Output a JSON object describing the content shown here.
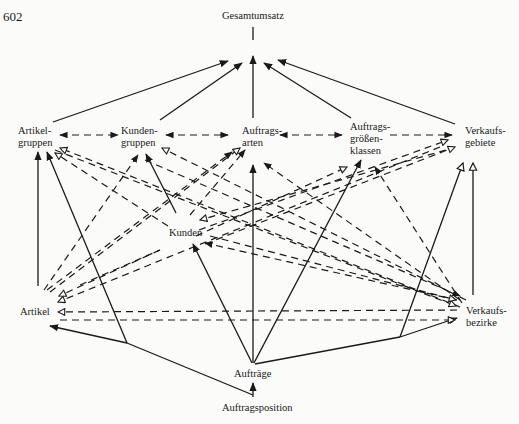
{
  "page": {
    "number": "602"
  },
  "diagram": {
    "title": "Gesamtumsatz",
    "nodes": {
      "gesamtumsatz": "Gesamtumsatz",
      "artikelgruppen": "Artikel-\ngruppen",
      "kundengruppen": "Kunden-\ngruppen",
      "auftragsarten": "Auftrags-\narten",
      "auftragsgroessenklassen": "Auftrags-\ngrößen-\nklassen",
      "verkaufsgebiete": "Verkaufs-\ngebiete",
      "kunden": "Kunden",
      "artikel": "Artikel",
      "verkaufsbezirke": "Verkaufs-\nbezirke",
      "auftraege": "Aufträge",
      "auftragsposition": "Auftragsposition"
    },
    "legend": {
      "solid_filled_arrow": "hierarchical aggregation",
      "dashed_open_arrow": "cross relation",
      "dashed_bidirectional": "same-level relation"
    },
    "colors": {
      "ink": "#1a1a1a",
      "paper": "#fbfbf9"
    }
  }
}
